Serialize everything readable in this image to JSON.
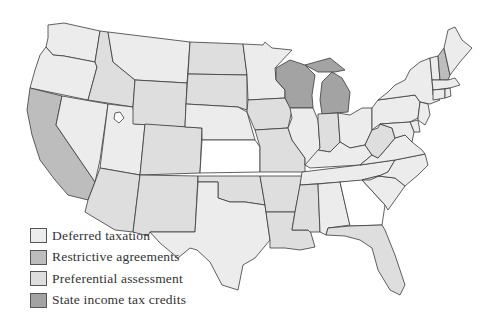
{
  "colors": {
    "deferred_taxation": "#ececec",
    "restrictive_agreements": "#bdbdbd",
    "preferential_assessment": "#dedede",
    "state_income_tax_credits": "#a3a3a3",
    "none": "#ffffff",
    "border": "#3a3a3a"
  },
  "legend": {
    "items": [
      {
        "label": "Deferred taxation",
        "category": "deferred_taxation",
        "color": "#ececec"
      },
      {
        "label": "Restrictive agreements",
        "category": "restrictive_agreements",
        "color": "#bdbdbd"
      },
      {
        "label": "Preferential assessment",
        "category": "preferential_assessment",
        "color": "#dedede"
      },
      {
        "label": "State income tax credits",
        "category": "state_income_tax_credits",
        "color": "#a3a3a3"
      }
    ]
  },
  "states": {
    "WA": "deferred_taxation",
    "OR": "deferred_taxation",
    "CA": "restrictive_agreements",
    "ID": "preferential_assessment",
    "NV": "deferred_taxation",
    "UT": "deferred_taxation",
    "AZ": "preferential_assessment",
    "MT": "deferred_taxation",
    "WY": "preferential_assessment",
    "CO": "preferential_assessment",
    "NM": "preferential_assessment",
    "ND": "preferential_assessment",
    "SD": "preferential_assessment",
    "NE": "deferred_taxation",
    "KS": "none",
    "OK": "preferential_assessment",
    "TX": "deferred_taxation",
    "MN": "deferred_taxation",
    "IA": "preferential_assessment",
    "MO": "preferential_assessment",
    "AR": "preferential_assessment",
    "LA": "preferential_assessment",
    "WI": "state_income_tax_credits",
    "MI": "state_income_tax_credits",
    "IL": "deferred_taxation",
    "IN": "preferential_assessment",
    "OH": "deferred_taxation",
    "KY": "deferred_taxation",
    "TN": "deferred_taxation",
    "MS": "preferential_assessment",
    "AL": "deferred_taxation",
    "GA": "none",
    "FL": "preferential_assessment",
    "SC": "deferred_taxation",
    "NC": "deferred_taxation",
    "VA": "deferred_taxation",
    "WV": "preferential_assessment",
    "PA": "deferred_taxation",
    "NY": "deferred_taxation",
    "VT": "deferred_taxation",
    "NH": "restrictive_agreements",
    "ME": "deferred_taxation",
    "MA": "deferred_taxation",
    "CT": "deferred_taxation",
    "RI": "deferred_taxation",
    "NJ": "deferred_taxation",
    "DE": "deferred_taxation",
    "MD": "deferred_taxation"
  }
}
